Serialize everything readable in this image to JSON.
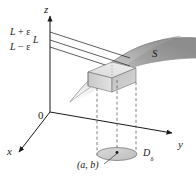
{
  "figure": {
    "type": "math-diagram-3d",
    "background_color": "#ffffff",
    "ink_color": "#1a1a1a",
    "surface_color_dark": "#8c8c8c",
    "surface_color_light": "#e8e8e8"
  },
  "axes": {
    "z_label": "z",
    "y_label": "y",
    "x_label": "x",
    "origin_label": "0"
  },
  "labels": {
    "upper": {
      "main": "L",
      "op": " + ",
      "eps": "ε"
    },
    "middle": {
      "main": "L"
    },
    "lower": {
      "main": "L",
      "op": " − ",
      "eps": "ε"
    },
    "surface": "S",
    "point": "(a, b)",
    "disk": {
      "main": "D",
      "sub": "δ"
    }
  },
  "geometry": {
    "z_levels": {
      "L_plus_eps": 32,
      "L": 40,
      "L_minus_eps": 47
    },
    "origin": {
      "x": 50,
      "y": 112
    },
    "z_axis_top": {
      "x": 50,
      "y": 14
    },
    "y_axis_end": {
      "x": 176,
      "y": 135
    },
    "x_axis_end": {
      "x": 16,
      "y": 155
    },
    "disk_center": {
      "x": 117,
      "y": 156
    },
    "disk_rx": 20,
    "disk_ry": 6
  }
}
